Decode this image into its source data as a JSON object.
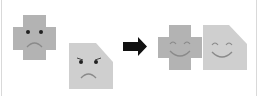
{
  "diagram": {
    "colors": {
      "cross": "#b3b3b3",
      "pentagon": "#cfcfcf",
      "face": "#3a3a3a",
      "smile": "#8a8a8a",
      "arrow": "#111111",
      "edge": "#d9d9d9"
    },
    "before": {
      "shapes": [
        {
          "type": "cross",
          "expression": "sad"
        },
        {
          "type": "pentagon",
          "expression": "sad-angry"
        }
      ]
    },
    "arrow": {
      "direction": "right"
    },
    "after": {
      "shapes": [
        {
          "type": "cross",
          "expression": "happy"
        },
        {
          "type": "pentagon",
          "expression": "happy"
        }
      ]
    }
  }
}
